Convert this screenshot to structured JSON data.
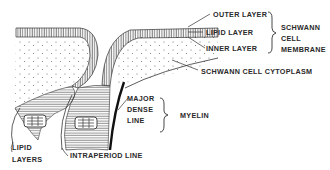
{
  "diagram": {
    "labels": {
      "outer_layer": "OUTER LAYER",
      "lipid_layer": "LIPID LAYER",
      "inner_layer": "INNER LAYER",
      "schwann_membrane_1": "SCHWANN",
      "schwann_membrane_2": "CELL",
      "schwann_membrane_3": "MEMBRANE",
      "cytoplasm": "SCHWANN CELL CYTOPLASM",
      "major_dense_1": "MAJOR",
      "major_dense_2": "DENSE",
      "major_dense_3": "LINE",
      "myelin": "MYELIN",
      "lipid_layers_1": "LIPID",
      "lipid_layers_2": "LAYERS",
      "intraperiod": "INTRAPERIOD LINE"
    },
    "colors": {
      "ink": "#333333",
      "background": "#ffffff"
    }
  }
}
